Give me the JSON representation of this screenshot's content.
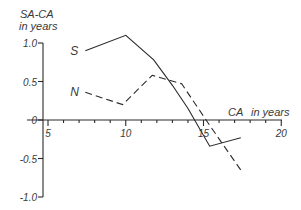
{
  "chart_data": {
    "type": "line",
    "title": "",
    "ylabel": "SA-CA",
    "ylabel_unit": "in years",
    "xlabel": "CA",
    "xlabel_unit": "in years",
    "xlim": [
      3.7,
      20
    ],
    "ylim": [
      -1.0,
      1.0
    ],
    "x_ticks": [
      5,
      6,
      7,
      8,
      9,
      10,
      11,
      12,
      13,
      14,
      15,
      16,
      17,
      18,
      19,
      20
    ],
    "x_tick_labels": [
      {
        "value": 5,
        "label": "5"
      },
      {
        "value": 10,
        "label": "10"
      },
      {
        "value": 15,
        "label": "15"
      },
      {
        "value": 20,
        "label": "20"
      }
    ],
    "y_ticks": [
      {
        "value": 1.0,
        "label": "1.0"
      },
      {
        "value": 0.5,
        "label": "0.5"
      },
      {
        "value": 0,
        "label": "0"
      },
      {
        "value": -0.5,
        "label": "-0.5"
      },
      {
        "value": -1.0,
        "label": "-1.0"
      }
    ],
    "grid": false,
    "legend": "inline labels at series start",
    "series": [
      {
        "name": "S",
        "style": "solid",
        "x": [
          7.4,
          10.0,
          11.8,
          13.0,
          14.0,
          15.4,
          17.4
        ],
        "y": [
          0.9,
          1.1,
          0.78,
          0.45,
          0.15,
          -0.34,
          -0.23
        ]
      },
      {
        "name": "N",
        "style": "dashed",
        "x": [
          7.4,
          9.8,
          11.7,
          13.6,
          15.5,
          17.4
        ],
        "y": [
          0.36,
          0.2,
          0.58,
          0.47,
          -0.1,
          -0.65
        ]
      }
    ]
  }
}
